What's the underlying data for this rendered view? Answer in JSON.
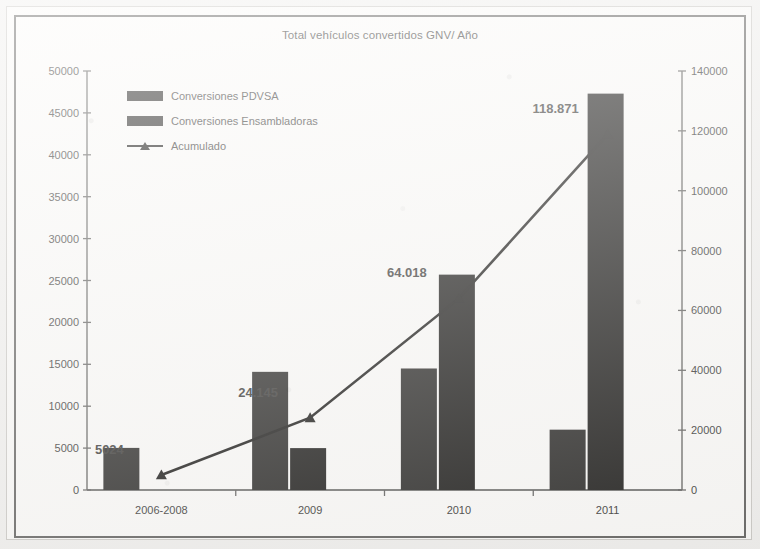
{
  "chart_data": {
    "type": "bar",
    "title": "Total vehículos convertidos GNV/ Año",
    "xlabel": "",
    "ylabel": "",
    "categories": [
      "2006-2008",
      "2009",
      "2010",
      "2011"
    ],
    "series": [
      {
        "name": "Conversiones PDVSA",
        "kind": "bar",
        "axis": "left",
        "color": "#3b3a38",
        "values": [
          5024,
          14100,
          14500,
          7200
        ]
      },
      {
        "name": "Conversiones Ensambladoras",
        "kind": "bar",
        "axis": "left",
        "color": "#2f2e2c",
        "values": [
          0,
          5000,
          25700,
          47300
        ]
      },
      {
        "name": "Acumulado",
        "kind": "line",
        "axis": "right",
        "color": "#2e2d2b",
        "marker": "triangle",
        "values": [
          5024,
          24145,
          64018,
          118871
        ],
        "point_labels": [
          "5024",
          "24.145",
          "64.018",
          "118.871"
        ]
      }
    ],
    "y_left": {
      "min": 0,
      "max": 50000,
      "step": 5000,
      "ticks": [
        "0",
        "5000",
        "10000",
        "15000",
        "20000",
        "25000",
        "30000",
        "35000",
        "40000",
        "45000",
        "50000"
      ]
    },
    "y_right": {
      "min": 0,
      "max": 140000,
      "step": 20000,
      "ticks": [
        "0",
        "20000",
        "40000",
        "60000",
        "80000",
        "100000",
        "120000",
        "140000"
      ]
    },
    "grid": false,
    "legend_position": "top-left",
    "legend": [
      {
        "label": "Conversiones PDVSA",
        "marker": "swatch"
      },
      {
        "label": "Conversiones Ensambladoras",
        "marker": "swatch"
      },
      {
        "label": "Acumulado",
        "marker": "line-triangle"
      }
    ]
  }
}
